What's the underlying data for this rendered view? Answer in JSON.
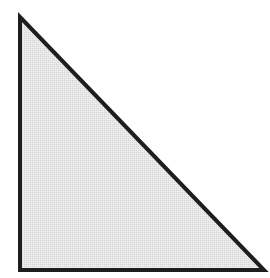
{
  "diagram": {
    "shape": "right-triangle",
    "vertices": {
      "top": [
        20,
        17
      ],
      "bottom_left": [
        20,
        270
      ],
      "bottom_right": [
        264,
        270
      ]
    },
    "fill_color": "#e4e4e4",
    "stroke_color": "#1e1e1e",
    "stroke_width": 4,
    "background_color": "#ffffff"
  }
}
